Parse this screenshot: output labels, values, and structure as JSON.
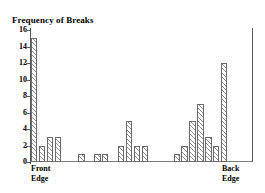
{
  "chart_data": {
    "type": "bar",
    "title": "Frequency of Breaks",
    "xlabel": "",
    "ylabel": "Frequency of Breaks",
    "ylim": [
      0,
      16
    ],
    "yticks": [
      0,
      2,
      4,
      6,
      8,
      10,
      12,
      14,
      16
    ],
    "ytick_labels": [
      "0",
      "2",
      "4",
      "6",
      "8",
      "10",
      "12",
      "14",
      "16"
    ],
    "grid": false,
    "legend": "none",
    "x_axis_start_label": "Front Edge",
    "x_axis_end_label": "Back Edge",
    "categories": [
      "1",
      "2",
      "3",
      "4",
      "5",
      "6",
      "7",
      "8",
      "9",
      "10",
      "11",
      "12",
      "13",
      "14",
      "15",
      "16",
      "17",
      "18",
      "19",
      "20",
      "21",
      "22",
      "23",
      "24",
      "25",
      "26",
      "27",
      "28"
    ],
    "values": [
      15,
      2,
      3,
      3,
      0,
      0,
      1,
      0,
      1,
      1,
      0,
      2,
      5,
      2,
      2,
      0,
      0,
      0,
      1,
      2,
      5,
      7,
      3,
      2,
      12,
      0,
      0,
      0
    ]
  },
  "labels": {
    "title": "Frequency of Breaks",
    "front_edge_line1": "Front",
    "front_edge_line2": "Edge",
    "back_edge_line1": "Back",
    "back_edge_line2": "Edge"
  },
  "style": {
    "bar_edge_color": "#6b6b6b",
    "hatch_color": "#8d8d8d",
    "axis_color": "#5a5a5a",
    "text_color": "#000000",
    "background": "#ffffff"
  }
}
